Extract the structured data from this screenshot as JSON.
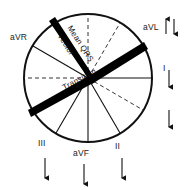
{
  "figure": {
    "type": "hexaxial-reference-diagram",
    "title": "",
    "center": {
      "x": 88,
      "y": 78
    },
    "radius": 64,
    "colors": {
      "stroke": "#111111",
      "thick_bar": "#000000",
      "dashed": "#333333",
      "background": "#ffffff"
    }
  },
  "lead_labels": [
    {
      "id": "aVR",
      "text": "aVR",
      "x": 10,
      "y": 33,
      "angle_deg": -150
    },
    {
      "id": "aVL",
      "text": "aVL",
      "x": 145,
      "y": 24,
      "angle_deg": -30
    },
    {
      "id": "I",
      "text": "I",
      "x": 164,
      "y": 66,
      "angle_deg": 0
    },
    {
      "id": "II",
      "text": "II",
      "x": 116,
      "y": 144,
      "angle_deg": 60
    },
    {
      "id": "aVF",
      "text": "aVF",
      "x": 74,
      "y": 150,
      "angle_deg": 90
    },
    {
      "id": "III",
      "text": "III",
      "x": 39,
      "y": 140,
      "angle_deg": 120
    }
  ],
  "vector_labels": [
    {
      "id": "mean-qrs-vector",
      "line1": "Mean QRS",
      "line2": "Vector",
      "rotation_deg": 62
    },
    {
      "id": "transition",
      "text": "Transition",
      "rotation_deg": 30
    }
  ],
  "arrows": [
    {
      "id": "avl-arrow-up",
      "near": "aVL",
      "direction": "up",
      "x": 166,
      "y": 20,
      "length": 16
    },
    {
      "id": "avl-arrow-down",
      "near": "aVL",
      "direction": "down",
      "x": 173,
      "y": 20,
      "length": 16
    },
    {
      "id": "lead-i-arrow-down",
      "near": "I",
      "direction": "down",
      "x": 168,
      "y": 72,
      "length": 18
    },
    {
      "id": "right-arrow-down",
      "near": "",
      "direction": "down",
      "x": 168,
      "y": 112,
      "length": 18
    },
    {
      "id": "iii-arrow-down",
      "near": "III",
      "direction": "down",
      "x": 44,
      "y": 155,
      "length": 22
    },
    {
      "id": "avf-arrow-down",
      "near": "aVF",
      "direction": "down",
      "x": 84,
      "y": 162,
      "length": 22
    },
    {
      "id": "ii-arrow-down",
      "near": "II",
      "direction": "down",
      "x": 120,
      "y": 158,
      "length": 22
    }
  ],
  "radial_lines_solid": [
    {
      "angle_deg": 0,
      "name": "lead-I-axis"
    },
    {
      "angle_deg": 60,
      "name": "lead-II-axis"
    },
    {
      "angle_deg": 90,
      "name": "lead-aVF-axis"
    },
    {
      "angle_deg": 120,
      "name": "lead-III-axis"
    },
    {
      "angle_deg": 210,
      "name": "lead-aVR-axis"
    }
  ],
  "radial_lines_dashed": [
    {
      "angle_deg": 180,
      "name": "dashed-axis-180"
    },
    {
      "angle_deg": 270,
      "name": "dashed-axis-270"
    },
    {
      "angle_deg": -60,
      "name": "dashed-axis-neg60"
    },
    {
      "angle_deg": 30,
      "name": "dashed-axis-30"
    },
    {
      "angle_deg": 150,
      "name": "dashed-axis-150"
    }
  ],
  "thick_bars": [
    {
      "id": "mean-qrs-bar",
      "from_angle_deg": -120,
      "to_angle_deg": -30,
      "width": 6
    }
  ]
}
